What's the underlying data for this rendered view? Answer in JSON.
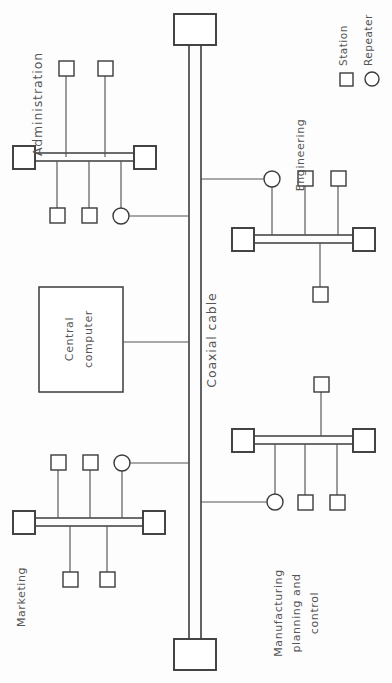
{
  "diagram": {
    "colors": {
      "background": "#fdfdfd",
      "stroke": "#3b3b3b",
      "line": "#555555",
      "text": "#555555",
      "shape_fill": "#ffffff"
    },
    "backbone": {
      "label": "Coaxial cable",
      "terminator_top": "",
      "terminator_bottom": ""
    },
    "central_computer": {
      "label_line_1": "Central",
      "label_line_2": "computer"
    },
    "segments": [
      {
        "id": "administration",
        "label": "Administration",
        "stations_above": 2,
        "stations_below": 2,
        "repeaters": 1
      },
      {
        "id": "engineering",
        "label": "Engineering",
        "stations_above": 2,
        "stations_below": 1,
        "repeaters": 1
      },
      {
        "id": "marketing",
        "label": "Marketing",
        "stations_above": 2,
        "stations_below": 2,
        "repeaters": 1
      },
      {
        "id": "manufacturing",
        "label_line_1": "Manufacturing",
        "label_line_2": "planning and",
        "label_line_3": "control",
        "stations_above": 1,
        "stations_below": 2,
        "repeaters": 1
      }
    ],
    "legend": {
      "items": [
        {
          "symbol": "square",
          "label": "Station"
        },
        {
          "symbol": "circle",
          "label": "Repeater"
        }
      ]
    }
  }
}
